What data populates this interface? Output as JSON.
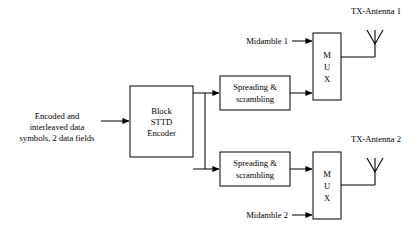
{
  "diagram": {
    "title_visible": false,
    "background_color": "#ffffff",
    "line_color": "#000000",
    "blocks": [
      {
        "id": "sttd-encoder",
        "lines": [
          "Block",
          "STTD",
          "Encoder"
        ],
        "x": 130,
        "y": 86,
        "w": 63,
        "h": 71
      },
      {
        "id": "spreading-top",
        "lines": [
          "Spreading &",
          "scrambling"
        ],
        "x": 220,
        "y": 76,
        "w": 70,
        "h": 34
      },
      {
        "id": "spreading-bottom",
        "lines": [
          "Spreading &",
          "scrambling"
        ],
        "x": 220,
        "y": 152,
        "w": 70,
        "h": 34
      },
      {
        "id": "mux-top",
        "lines": [
          "M",
          "U",
          "X"
        ],
        "x": 313,
        "y": 33,
        "w": 28,
        "h": 67
      },
      {
        "id": "mux-bottom",
        "lines": [
          "M",
          "U",
          "X"
        ],
        "x": 313,
        "y": 152,
        "w": 28,
        "h": 67
      }
    ],
    "labels": {
      "input_line1": "Encoded and",
      "input_line2": "interleaved data",
      "input_line3": "symbols, 2 data fields",
      "midamble_1": "Midamble 1",
      "midamble_2": "Midamble 2",
      "tx_antenna_1": "TX-Antenna 1",
      "tx_antenna_2": "TX-Antenna 2"
    }
  }
}
